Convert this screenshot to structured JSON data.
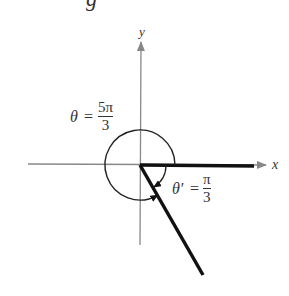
{
  "diagram": {
    "top_fragment": "g",
    "axes": {
      "x_label": "x",
      "y_label": "y"
    },
    "angle": {
      "symbol": "θ",
      "equals": "=",
      "numerator": "5π",
      "denominator": "3"
    },
    "reference_angle": {
      "symbol": "θ′",
      "equals": "=",
      "numerator": "π",
      "denominator": "3"
    },
    "colors": {
      "axis": "#888888",
      "ray": "#111111",
      "text": "#333333"
    }
  }
}
